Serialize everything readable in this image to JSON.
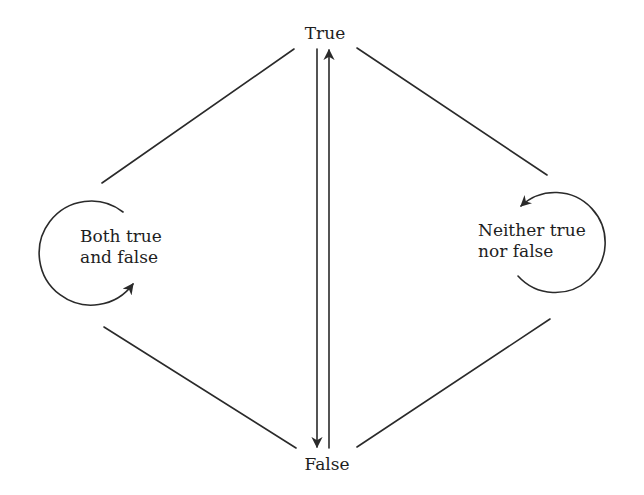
{
  "diagram": {
    "type": "state-transition",
    "nodes": {
      "top": {
        "id": "true",
        "label": "True"
      },
      "bottom": {
        "id": "false",
        "label": "False"
      },
      "left": {
        "id": "both",
        "label_lines": [
          "Both true",
          "and false"
        ],
        "self_loop": true
      },
      "right": {
        "id": "neither",
        "label_lines": [
          "Neither true",
          "nor false"
        ],
        "self_loop": true
      }
    },
    "edges": [
      {
        "from": "both",
        "to": "true",
        "directed": false
      },
      {
        "from": "true",
        "to": "neither",
        "directed": false
      },
      {
        "from": "both",
        "to": "false",
        "directed": false
      },
      {
        "from": "false",
        "to": "neither",
        "directed": false
      },
      {
        "from": "true",
        "to": "false",
        "directed": true
      },
      {
        "from": "false",
        "to": "true",
        "directed": true
      },
      {
        "from": "both",
        "to": "both",
        "directed": true,
        "kind": "self-loop"
      },
      {
        "from": "neither",
        "to": "neither",
        "directed": true,
        "kind": "self-loop"
      }
    ],
    "colors": {
      "line": "#2a2a2a",
      "text": "#1e1e1e",
      "background": "#ffffff"
    }
  }
}
